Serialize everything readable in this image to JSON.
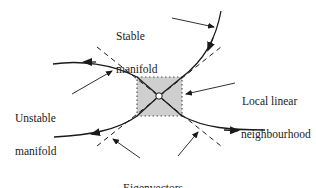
{
  "diagram": {
    "labels": {
      "stable_manifold": [
        "Stable",
        "manifold"
      ],
      "unstable_manifold": [
        "Unstable",
        "manifold"
      ],
      "local_linear_neighbourhood": [
        "Local linear",
        "neighbourhood"
      ],
      "eigenvectors": "Eigenvectors"
    },
    "colors": {
      "stroke": "#1a1a1a",
      "neighbourhood_fill": "#cfcfcf",
      "background": "#ffffff"
    },
    "elements": {
      "fixed_point": "saddle point (hyperbolic fixed point)",
      "neighbourhood_box": "shaded dotted rectangle around fixed point",
      "stable_flow_direction": "towards fixed point",
      "unstable_flow_direction": "away from fixed point",
      "eigenvector_lines": "dashed tangent lines through fixed point"
    }
  }
}
